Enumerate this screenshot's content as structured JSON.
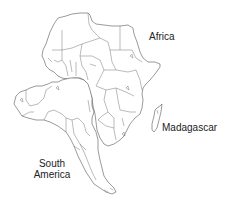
{
  "map": {
    "description": "Outline map comparing Africa with South America overlaid, showing country borders",
    "colors": {
      "background": "#ffffff",
      "outline": "#555555",
      "text": "#222222"
    },
    "labels": {
      "africa": "Africa",
      "madagascar": "Madagascar",
      "south_america_line1": "South",
      "south_america_line2": "America"
    }
  }
}
